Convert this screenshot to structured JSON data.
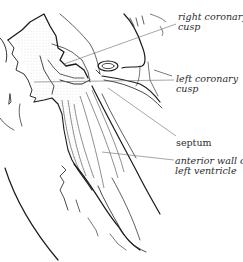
{
  "figure": {
    "type": "anatomical line drawing"
  },
  "labels": {
    "right_coronary_cusp": {
      "line1": "right coronary",
      "line2": "cusp"
    },
    "left_coronary_cusp": {
      "line1": "left coronary",
      "line2": "cusp"
    },
    "septum": {
      "line1": "septum"
    },
    "anterior_wall": {
      "line1": "anterior wall of",
      "line2": "left ventricle"
    }
  },
  "colors": {
    "ink": "#1a1a1a",
    "leader": "#6a6a6a",
    "stipple": "#9a9a9a"
  }
}
